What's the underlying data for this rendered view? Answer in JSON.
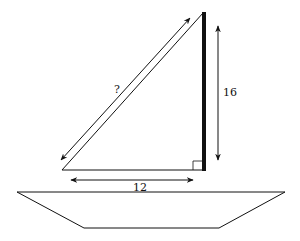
{
  "diagram": {
    "labels": {
      "hypotenuse": "?",
      "height": "16",
      "base": "12"
    },
    "colors": {
      "stroke": "#111111",
      "background": "#ffffff"
    },
    "geometry": {
      "mast": {
        "x": 204,
        "y_top": 12,
        "y_bottom": 170
      },
      "sail_base": {
        "x1": 62,
        "x2": 204,
        "y": 170
      },
      "hypotenuse": {
        "x1": 62,
        "y1": 170,
        "x2": 202,
        "y2": 13
      },
      "hull_top": {
        "x1": 17,
        "x2": 285,
        "y": 192
      },
      "hull_bottom": {
        "x1": 84,
        "x2": 219,
        "y": 228
      }
    }
  }
}
